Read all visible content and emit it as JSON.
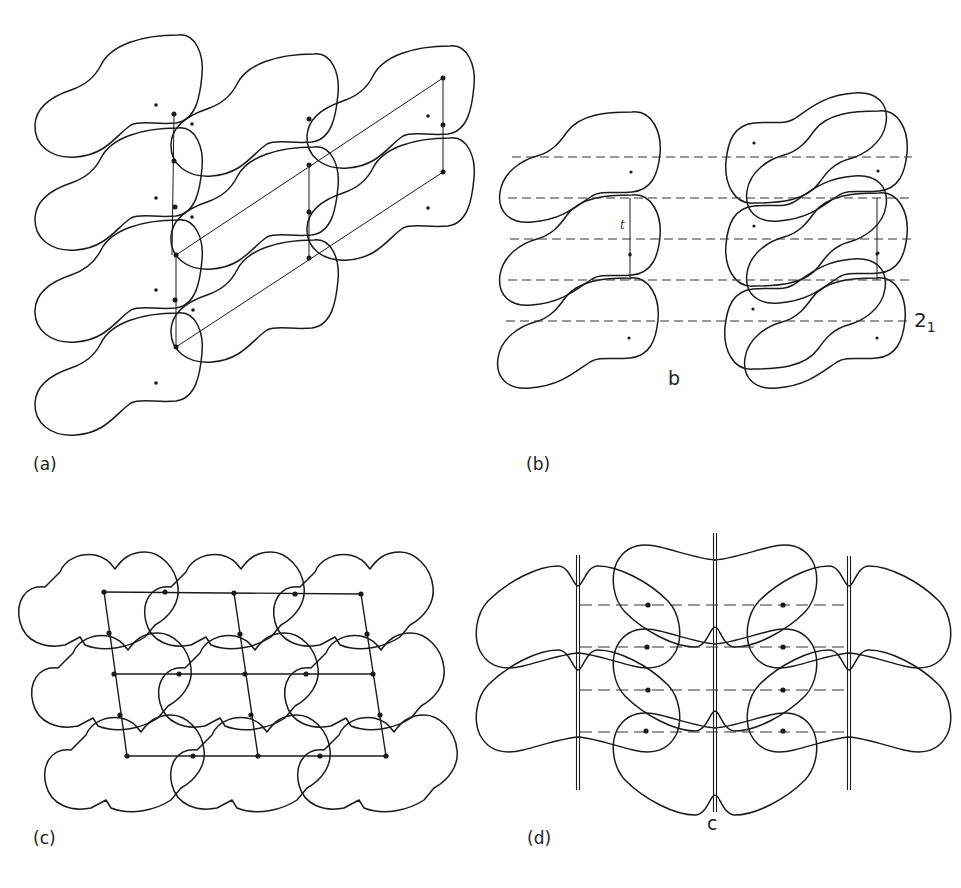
{
  "figure": {
    "panels": [
      {
        "id": "a",
        "label": "(a)",
        "description": "Translational packing of asymmetric molecules with oblique unit cell",
        "molecule_columns": [
          4,
          3,
          2
        ],
        "lattice": "oblique"
      },
      {
        "id": "b",
        "label": "(b)",
        "description": "Packing generated by 2-fold screw axes (dashed lines)",
        "axis_label": "b",
        "translation_label": "t",
        "symmetry_label": "2",
        "symmetry_subscript": "1",
        "screw_axis_count": 5,
        "molecule_columns": [
          3,
          3,
          3
        ]
      },
      {
        "id": "c",
        "label": "(c)",
        "description": "Close packing of cloud-shaped molecules on an oblique lattice",
        "lattice_rows": 3,
        "lattice_columns": 3
      },
      {
        "id": "d",
        "label": "(d)",
        "description": "Packing with mirror planes (double lines) and glide planes (dashed lines)",
        "axis_label": "c",
        "mirror_planes": 3,
        "dashed_lines": 4
      }
    ]
  },
  "colors": {
    "line": "#1a1a1a",
    "background": "#ffffff"
  }
}
